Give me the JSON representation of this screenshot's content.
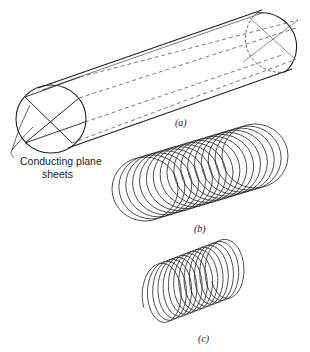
{
  "figure": {
    "panels": [
      {
        "id": "a",
        "label": "(a)",
        "description": "cylinder with conducting plane sheets"
      },
      {
        "id": "b",
        "label": "(b)",
        "description": "array of circular rings"
      },
      {
        "id": "c",
        "label": "(c)",
        "description": "helical coil"
      }
    ],
    "annotation": {
      "line1": "Conducting plane",
      "line2": "sheets"
    },
    "rings_b_count": 17,
    "turns_c_count": 13,
    "caption_truncated": "Fig. 6.10  Alternative representations of an electric helix..."
  }
}
